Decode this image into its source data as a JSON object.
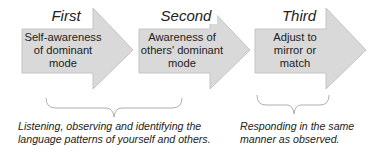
{
  "steps": [
    {
      "title": "First",
      "text": "Self-awareness of dominant mode"
    },
    {
      "title": "Second",
      "text": "Awareness of others' dominant mode"
    },
    {
      "title": "Third",
      "text": "Adjust to mirror or match"
    }
  ],
  "captions": [
    {
      "line1": "Listening, observing and identifying the",
      "line2": "language patterns of yourself and others."
    },
    {
      "line1": "Responding in the same",
      "line2": "manner as observed."
    }
  ],
  "colors": {
    "arrow_fill": "#d9d9d9",
    "arrow_stroke": "#bdbdbd",
    "brace": "#9a9a9a"
  }
}
